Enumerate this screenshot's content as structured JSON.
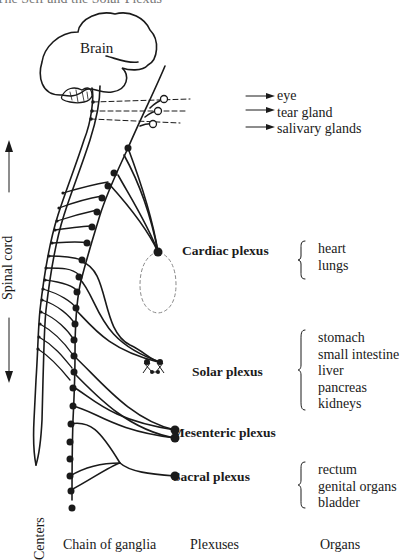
{
  "title": "The Self and the Solar Plexus",
  "brain_label": "Brain",
  "head_organs": [
    "eye",
    "tear gland",
    "salivary glands"
  ],
  "axis_label": "Spinal cord",
  "plexuses": [
    {
      "name": "Cardiac plexus",
      "organs": [
        "heart",
        "lungs"
      ]
    },
    {
      "name": "Solar plexus",
      "organs": [
        "stomach",
        "small intestine",
        "liver",
        "pancreas",
        "kidneys"
      ]
    },
    {
      "name": "Mesenteric plexus",
      "organs": []
    },
    {
      "name": "Sacral plexus",
      "organs": [
        "rectum",
        "genital organs",
        "bladder"
      ]
    }
  ],
  "column_labels": {
    "centers": "Centers",
    "chain": "Chain of ganglia",
    "plexuses": "Plexuses",
    "organs": "Organs"
  }
}
